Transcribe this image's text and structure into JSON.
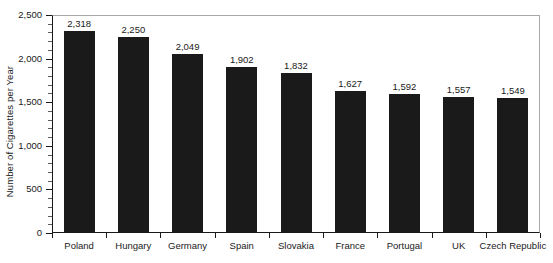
{
  "chart_data": {
    "type": "bar",
    "title": "",
    "xlabel": "",
    "ylabel": "Number of Cigarettes per Year",
    "categories": [
      "Poland",
      "Hungary",
      "Germany",
      "Spain",
      "Slovakia",
      "France",
      "Portugal",
      "UK",
      "Czech Republic"
    ],
    "values": [
      2318,
      2250,
      2049,
      1902,
      1832,
      1627,
      1592,
      1557,
      1549
    ],
    "value_labels": [
      "2,318",
      "2,250",
      "2,049",
      "1,902",
      "1,832",
      "1,627",
      "1,592",
      "1,557",
      "1,549"
    ],
    "ylim": [
      0,
      2500
    ],
    "ytick_values": [
      0,
      500,
      1000,
      1500,
      2000,
      2500
    ],
    "ytick_labels": [
      "0",
      "500",
      "1,000",
      "1,500",
      "2,000",
      "2,500"
    ],
    "yminor_step": 100,
    "grid": false,
    "legend": null,
    "bar_color": "#1a1a1a",
    "background_color": "#ffffff",
    "axis_color": "#1a1a1a",
    "frame_color": "#a8a8a8"
  }
}
